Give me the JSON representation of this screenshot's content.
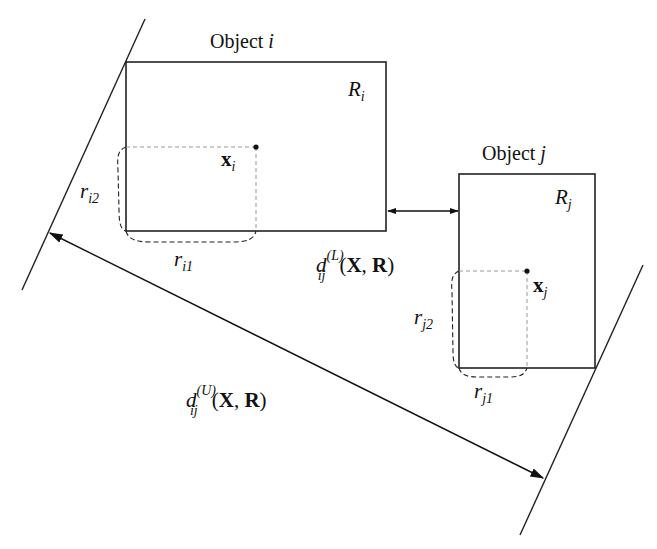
{
  "diagram": {
    "objects": [
      {
        "id": "i",
        "title_prefix": "Object ",
        "title_var": "i",
        "region_label": "R",
        "region_sub": "i",
        "center_label": "x",
        "center_sub": "i",
        "r1_label": "r",
        "r1_sub": "i1",
        "r2_label": "r",
        "r2_sub": "i2"
      },
      {
        "id": "j",
        "title_prefix": "Object ",
        "title_var": "j",
        "region_label": "R",
        "region_sub": "j",
        "center_label": "x",
        "center_sub": "j",
        "r1_label": "r",
        "r1_sub": "j1",
        "r2_label": "r",
        "r2_sub": "j2"
      }
    ],
    "lower_distance": {
      "symbol": "d",
      "sub": "ij",
      "sup": "(L)",
      "args_open": "(",
      "arg1": "X",
      "sep": ", ",
      "arg2": "R",
      "args_close": ")"
    },
    "upper_distance": {
      "symbol": "d",
      "sub": "ij",
      "sup": "(U)",
      "args_open": "(",
      "arg1": "X",
      "sep": ", ",
      "arg2": "R",
      "args_close": ")"
    },
    "colors": {
      "stroke": "#222222",
      "dashed": "#999999"
    }
  }
}
